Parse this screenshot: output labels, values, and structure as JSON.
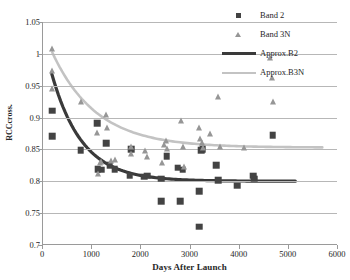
{
  "chart_data": {
    "type": "scatter",
    "title": "",
    "xlabel": "Days After Launch",
    "ylabel": "RCCcross.",
    "xlim": [
      0,
      6000
    ],
    "ylim": [
      0.7,
      1.05
    ],
    "xticks": [
      0,
      1000,
      2000,
      3000,
      4000,
      5000,
      6000
    ],
    "yticks": [
      0.7,
      0.75,
      0.8,
      0.85,
      0.9,
      0.95,
      1,
      1.05
    ],
    "ytick_labels": [
      "0.7",
      "0.75",
      "0.8",
      "0.85",
      "0.9",
      "0.95",
      "1",
      "1.05"
    ],
    "xtick_labels": [
      "0",
      "1000",
      "2000",
      "3000",
      "4000",
      "5000",
      "6000"
    ],
    "grid": "horizontal",
    "legend_position": "top-right",
    "series": [
      {
        "name": "Band 2",
        "marker": "square",
        "color": "#434343",
        "points": [
          [
            190,
            0.911
          ],
          [
            190,
            0.871
          ],
          [
            770,
            0.849
          ],
          [
            1100,
            0.891
          ],
          [
            1110,
            0.819
          ],
          [
            1180,
            0.818
          ],
          [
            1290,
            0.86
          ],
          [
            1360,
            0.825
          ],
          [
            1460,
            0.819
          ],
          [
            1760,
            0.809
          ],
          [
            1790,
            0.85
          ],
          [
            2060,
            0.807
          ],
          [
            2120,
            0.809
          ],
          [
            2400,
            0.804
          ],
          [
            2410,
            0.769
          ],
          [
            2520,
            0.839
          ],
          [
            2740,
            0.821
          ],
          [
            2790,
            0.769
          ],
          [
            2840,
            0.818
          ],
          [
            3180,
            0.784
          ],
          [
            3180,
            0.729
          ],
          [
            3220,
            0.849
          ],
          [
            3250,
            0.85
          ],
          [
            3520,
            0.825
          ],
          [
            3560,
            0.802
          ],
          [
            3950,
            0.793
          ],
          [
            4270,
            0.809
          ],
          [
            4290,
            0.804
          ],
          [
            4670,
            0.872
          ]
        ]
      },
      {
        "name": "Band 3N",
        "marker": "triangle",
        "color": "#969696",
        "points": [
          [
            175,
            0.968
          ],
          [
            180,
            0.94
          ],
          [
            190,
            1.002
          ],
          [
            770,
            0.919
          ],
          [
            1090,
            0.871
          ],
          [
            1110,
            0.806
          ],
          [
            1150,
            0.823
          ],
          [
            1180,
            0.826
          ],
          [
            1290,
            0.899
          ],
          [
            1300,
            0.879
          ],
          [
            1380,
            0.827
          ],
          [
            1460,
            0.828
          ],
          [
            1780,
            0.849
          ],
          [
            1790,
            0.838
          ],
          [
            2080,
            0.843
          ],
          [
            2120,
            0.833
          ],
          [
            2420,
            0.824
          ],
          [
            2470,
            0.852
          ],
          [
            2500,
            0.858
          ],
          [
            2520,
            0.846
          ],
          [
            2800,
            0.889
          ],
          [
            2840,
            0.849
          ],
          [
            2870,
            0.818
          ],
          [
            3180,
            0.878
          ],
          [
            3200,
            0.861
          ],
          [
            3230,
            0.855
          ],
          [
            3250,
            0.848
          ],
          [
            3400,
            0.869
          ],
          [
            3560,
            0.928
          ],
          [
            3600,
            0.849
          ],
          [
            4090,
            0.848
          ],
          [
            4610,
            0.988
          ],
          [
            4660,
            0.957
          ],
          [
            4680,
            0.919
          ]
        ]
      }
    ],
    "fits": [
      {
        "name": "Approx.B2",
        "color": "#3a3a3a",
        "width": 3.2,
        "form": "exponential-decay",
        "y_start": 0.968,
        "y_asymptote": 0.799,
        "x_start": 180,
        "x_end": 5150,
        "decay_days": 620
      },
      {
        "name": "Approx.B3N",
        "color": "#c3c3c3",
        "width": 2.6,
        "form": "exponential-decay",
        "y_start": 1.002,
        "y_asymptote": 0.852,
        "x_start": 190,
        "x_end": 5700,
        "decay_days": 900
      }
    ]
  },
  "legend": {
    "items": [
      {
        "label": "Band 2",
        "key": "square"
      },
      {
        "label": "Band 3N",
        "key": "triangle"
      },
      {
        "label": "Approx.B2",
        "key": "line-dark"
      },
      {
        "label": "Approx.B3N",
        "key": "line-light"
      }
    ]
  }
}
